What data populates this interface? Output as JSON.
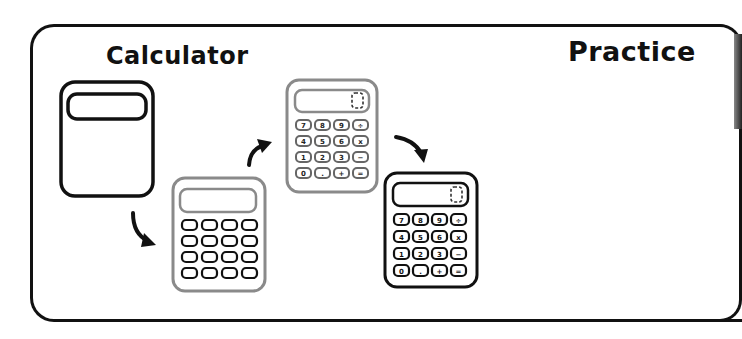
{
  "header": {
    "left_title": "Calculator",
    "right_title": "Practice"
  },
  "colors": {
    "outline": "#111111",
    "gray_outline": "#8a8a8a",
    "background": "#ffffff"
  },
  "calculators": [
    {
      "id": "blank",
      "stroke": "dark",
      "has_keys": false
    },
    {
      "id": "blank-keys",
      "stroke": "gray",
      "has_keys": true,
      "labeled": false
    },
    {
      "id": "labeled-gray",
      "stroke": "gray",
      "has_keys": true,
      "labeled": true
    },
    {
      "id": "labeled-dark",
      "stroke": "dark",
      "has_keys": true,
      "labeled": true
    }
  ],
  "keypad": {
    "rows": [
      [
        "7",
        "8",
        "9",
        "÷"
      ],
      [
        "4",
        "5",
        "6",
        "x"
      ],
      [
        "1",
        "2",
        "3",
        "−"
      ],
      [
        "0",
        ".",
        "+",
        "="
      ]
    ]
  },
  "arrows": [
    {
      "from": "blank",
      "to": "blank-keys",
      "icon": "curved-arrow-down-right-icon"
    },
    {
      "from": "blank-keys",
      "to": "labeled-gray",
      "icon": "curved-arrow-up-right-icon"
    },
    {
      "from": "labeled-gray",
      "to": "labeled-dark",
      "icon": "curved-arrow-down-right-icon"
    }
  ]
}
